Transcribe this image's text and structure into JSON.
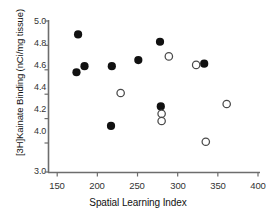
{
  "chart_data": {
    "type": "scatter",
    "title": "",
    "xlabel": "Spatial Learning Index",
    "ylabel": "[3H]Kainate Binding (nCi/mg tissue)",
    "xlim": [
      150,
      400
    ],
    "ylim": [
      3.0,
      5.0
    ],
    "xticks": [
      150,
      200,
      250,
      300,
      350,
      400
    ],
    "yticks": [
      5.0,
      4.8,
      4.6,
      4.4,
      4.2,
      4.0,
      3.0
    ],
    "ytick_labels": [
      "5.0",
      "4.8",
      "4.6",
      "4.4",
      "4.2",
      "4.0",
      "3.0"
    ],
    "xtick_labels": [
      "150",
      "200",
      "250",
      "300",
      "350",
      "400"
    ],
    "grid": false,
    "legend": "none",
    "y_axis_break": true,
    "y_axis_note": "linear 4.0-5.0, break below 4.0 down to 3.0",
    "series": [
      {
        "name": "filled",
        "marker": "filled-circle",
        "color": "#111111",
        "points": [
          {
            "x": 176,
            "y": 4.89
          },
          {
            "x": 174,
            "y": 4.58
          },
          {
            "x": 184,
            "y": 4.63
          },
          {
            "x": 218,
            "y": 4.63
          },
          {
            "x": 217,
            "y": 4.14
          },
          {
            "x": 251,
            "y": 4.68
          },
          {
            "x": 278,
            "y": 4.83
          },
          {
            "x": 279,
            "y": 4.3
          },
          {
            "x": 333,
            "y": 4.65
          }
        ]
      },
      {
        "name": "open",
        "marker": "open-circle",
        "color": "#ffffff",
        "edge_color": "#4a4a4a",
        "points": [
          {
            "x": 229,
            "y": 4.41
          },
          {
            "x": 289,
            "y": 4.71
          },
          {
            "x": 280,
            "y": 4.24
          },
          {
            "x": 280,
            "y": 4.18
          },
          {
            "x": 323,
            "y": 4.64
          },
          {
            "x": 335,
            "y": 4.01
          },
          {
            "x": 361,
            "y": 4.32
          }
        ]
      }
    ]
  }
}
